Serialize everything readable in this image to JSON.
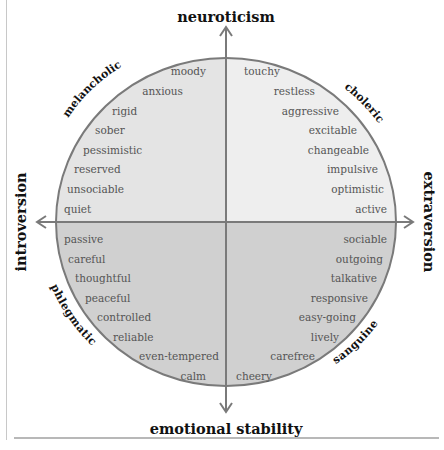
{
  "axes": {
    "top": "neuroticism",
    "bottom": "emotional stability",
    "left": "introversion",
    "right": "extraversion"
  },
  "temperaments": {
    "top_left": "melancholic",
    "top_right": "choleric",
    "bottom_left": "phlegmatic",
    "bottom_right": "sanguine"
  },
  "quadrants": {
    "melancholic": [
      "moody",
      "anxious",
      "rigid",
      "sober",
      "pessimistic",
      "reserved",
      "unsociable",
      "quiet"
    ],
    "choleric": [
      "touchy",
      "restless",
      "aggressive",
      "excitable",
      "changeable",
      "impulsive",
      "optimistic",
      "active"
    ],
    "phlegmatic": [
      "passive",
      "careful",
      "thoughtful",
      "peaceful",
      "controlled",
      "reliable",
      "even-tempered",
      "calm"
    ],
    "sanguine": [
      "sociable",
      "outgoing",
      "talkative",
      "responsive",
      "easy-going",
      "lively",
      "carefree",
      "cheery"
    ]
  },
  "colors": {
    "top_left_fill": "#e4e4e4",
    "top_right_fill": "#eeeeee",
    "bottom_fill": "#d0d0d0",
    "stroke": "#7a7a7a"
  }
}
